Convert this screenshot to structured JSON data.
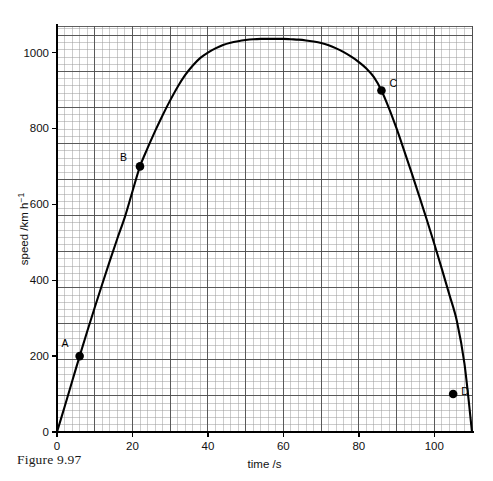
{
  "figure": {
    "caption": "Figure 9.97"
  },
  "chart_data": {
    "type": "line",
    "title": "",
    "xlabel": "time /s",
    "ylabel": "speed /km h⁻¹",
    "ylabel_parts": {
      "base": "speed /km h",
      "exponent": "−1"
    },
    "xlim": [
      0,
      110
    ],
    "ylim": [
      0,
      1070
    ],
    "grid": true,
    "grid_minor_step_x": 2,
    "grid_minor_step_y": 19.0,
    "grid_major_step_x": 10,
    "grid_major_step_y": 95.0,
    "xticks": [
      0,
      20,
      40,
      60,
      80,
      100
    ],
    "xtick_labels": [
      "0",
      "20",
      "40",
      "60",
      "80",
      "100"
    ],
    "yticks": [
      0,
      200,
      400,
      600,
      800,
      1000
    ],
    "ytick_labels": [
      "0",
      "200",
      "400",
      "600",
      "800",
      "1000"
    ],
    "legend": null,
    "series": [
      {
        "name": "speed",
        "x": [
          0,
          2,
          4,
          6,
          8,
          10,
          12,
          14,
          16,
          18,
          20,
          22,
          24,
          26,
          28,
          30,
          32,
          34,
          36,
          38,
          40,
          42,
          44,
          46,
          48,
          50,
          52,
          54,
          56,
          58,
          60,
          62,
          64,
          66,
          68,
          70,
          72,
          74,
          76,
          78,
          80,
          82,
          84,
          86,
          88,
          90,
          92,
          94,
          96,
          98,
          100,
          102,
          104,
          106,
          108,
          110
        ],
        "y": [
          0,
          66,
          133,
          200,
          265,
          328,
          390,
          451,
          510,
          567,
          634,
          700,
          748,
          793,
          835,
          874,
          910,
          941,
          966,
          986,
          1000,
          1011,
          1020,
          1026,
          1030,
          1033,
          1035,
          1036,
          1036,
          1036,
          1036,
          1035,
          1034,
          1032,
          1029,
          1025,
          1019,
          1011,
          1001,
          989,
          975,
          958,
          935,
          900,
          853,
          800,
          742,
          683,
          622,
          560,
          496,
          430,
          362,
          292,
          180,
          0
        ]
      }
    ],
    "annotations": [
      {
        "label": "A",
        "x": 6,
        "y": 200,
        "label_dx": -11,
        "label_dy": -9
      },
      {
        "label": "B",
        "x": 22,
        "y": 700,
        "label_dx": -13,
        "label_dy": -5
      },
      {
        "label": "C",
        "x": 86,
        "y": 900,
        "label_dx": 8,
        "label_dy": -4
      },
      {
        "label": "D",
        "x": 105,
        "y": 100,
        "label_dx": 8,
        "label_dy": 1
      }
    ],
    "colors": {
      "curve": "#000000",
      "axis": "#000000",
      "grid_minor": "#9a9a9a",
      "grid_major": "#4d4d4d",
      "marker": "#000000",
      "background": "#ffffff"
    }
  },
  "plot_geometry": {
    "left": 57,
    "right": 472,
    "top": 26,
    "bottom": 432
  }
}
